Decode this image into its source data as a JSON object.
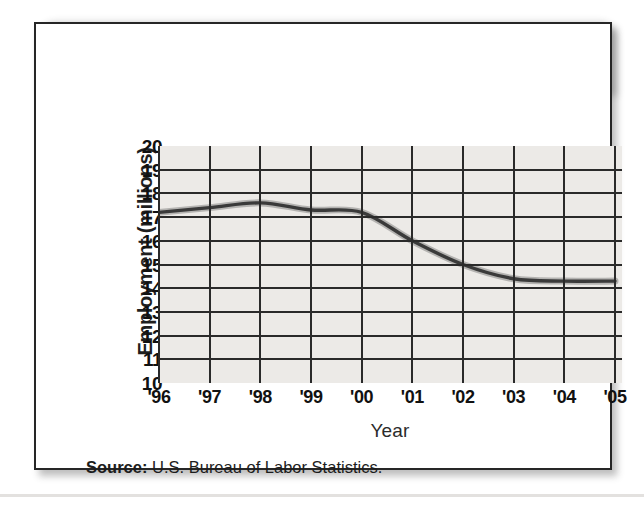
{
  "figure": {
    "title": "Employment in Manufacturing",
    "source_label": "Source:",
    "source_text": " U.S. Bureau of Labor Statistics."
  },
  "colors": {
    "banner_background": "#1c1a18",
    "title_text": "#ffffff",
    "plot_background": "#eceae7",
    "gridline": "#2a2a2a",
    "data_line": "#3a3a3a",
    "card_border": "#262626",
    "page_background": "#ffffff"
  },
  "chart_data": {
    "type": "line",
    "title": "Employment in Manufacturing",
    "xlabel": "Year",
    "ylabel": "Employment (millions)",
    "categories": [
      "'96",
      "'97",
      "'98",
      "'99",
      "'00",
      "'01",
      "'02",
      "'03",
      "'04",
      "'05"
    ],
    "x": [
      1996,
      1997,
      1998,
      1999,
      2000,
      2001,
      2002,
      2003,
      2004,
      2005
    ],
    "values": [
      17.2,
      17.4,
      17.6,
      17.3,
      17.2,
      16.0,
      15.0,
      14.4,
      14.3,
      14.3
    ],
    "series": [
      {
        "name": "Employment in Manufacturing",
        "values": [
          17.2,
          17.4,
          17.6,
          17.3,
          17.2,
          16.0,
          15.0,
          14.4,
          14.3,
          14.3
        ]
      }
    ],
    "ylim": [
      10,
      20
    ],
    "ytick_labels": [
      "20",
      "19",
      "18",
      "17",
      "16",
      "15",
      "14",
      "13",
      "12",
      "11",
      "10"
    ],
    "yticks": [
      20,
      19,
      18,
      17,
      16,
      15,
      14,
      13,
      12,
      11,
      10
    ],
    "xtick_labels": [
      "'96",
      "'97",
      "'98",
      "'99",
      "'00",
      "'01",
      "'02",
      "'03",
      "'04",
      "'05"
    ],
    "grid": true,
    "legend": "none",
    "units": "millions"
  }
}
